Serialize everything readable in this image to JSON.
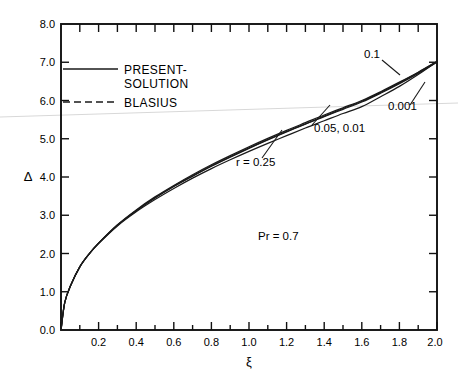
{
  "chart_data": {
    "type": "line",
    "title": "",
    "xlabel": "ξ",
    "ylabel": "Δ",
    "xlim": [
      0.0,
      2.0
    ],
    "ylim": [
      0.0,
      8.0
    ],
    "grid": false,
    "legend_position": "upper-left-inside",
    "x_ticks": [
      0.0,
      0.2,
      0.4,
      0.6,
      0.8,
      1.0,
      1.2,
      1.4,
      1.6,
      1.8,
      2.0
    ],
    "x_tick_labels": [
      "",
      "0.2",
      "0.4",
      "0.6",
      "0.8",
      "1.0",
      "1.2",
      "1.4",
      "1.6",
      "1.8",
      "2.0"
    ],
    "x_minor_step": 0.1,
    "y_ticks": [
      0.0,
      1.0,
      2.0,
      3.0,
      4.0,
      5.0,
      6.0,
      7.0,
      8.0
    ],
    "y_tick_labels": [
      "0.0",
      "1.0",
      "2.0",
      "3.0",
      "4.0",
      "5.0",
      "6.0",
      "7.0",
      "8.0"
    ],
    "series": [
      {
        "name": "r = 0.25",
        "style": "solid",
        "x": [
          0.0,
          0.02,
          0.05,
          0.1,
          0.15,
          0.2,
          0.3,
          0.4,
          0.5,
          0.6,
          0.7,
          0.8,
          0.9,
          1.0,
          1.1,
          1.2,
          1.3,
          1.4,
          1.5,
          1.6,
          1.7,
          1.8,
          1.9,
          2.0
        ],
        "y": [
          0.0,
          0.72,
          1.15,
          1.65,
          1.99,
          2.26,
          2.72,
          3.09,
          3.41,
          3.7,
          3.97,
          4.22,
          4.45,
          4.67,
          4.88,
          5.08,
          5.28,
          5.47,
          5.66,
          5.84,
          6.1,
          6.37,
          6.68,
          7.02
        ]
      },
      {
        "name": "0.1",
        "style": "solid",
        "x": [
          0.0,
          0.02,
          0.05,
          0.1,
          0.15,
          0.2,
          0.3,
          0.4,
          0.5,
          0.6,
          0.7,
          0.8,
          0.9,
          1.0,
          1.1,
          1.2,
          1.3,
          1.4,
          1.5,
          1.6,
          1.7,
          1.8,
          1.9,
          2.0
        ],
        "y": [
          0.0,
          0.72,
          1.15,
          1.65,
          1.99,
          2.27,
          2.75,
          3.14,
          3.48,
          3.78,
          4.06,
          4.32,
          4.56,
          4.79,
          5.01,
          5.22,
          5.42,
          5.62,
          5.81,
          6.0,
          6.23,
          6.48,
          6.74,
          7.02
        ]
      },
      {
        "name": "0.05, 0.01",
        "style": "solid",
        "x": [
          0.0,
          0.02,
          0.05,
          0.1,
          0.15,
          0.2,
          0.3,
          0.4,
          0.5,
          0.6,
          0.7,
          0.8,
          0.9,
          1.0,
          1.1,
          1.2,
          1.3,
          1.4,
          1.5,
          1.6,
          1.7,
          1.8,
          1.9,
          2.0
        ],
        "y": [
          0.0,
          0.72,
          1.15,
          1.65,
          1.99,
          2.27,
          2.74,
          3.12,
          3.46,
          3.76,
          4.03,
          4.29,
          4.53,
          4.76,
          4.98,
          5.19,
          5.39,
          5.59,
          5.79,
          5.98,
          6.21,
          6.46,
          6.73,
          7.02
        ]
      },
      {
        "name": "0.001",
        "style": "solid",
        "x": [
          0.0,
          0.02,
          0.05,
          0.1,
          0.15,
          0.2,
          0.3,
          0.4,
          0.5,
          0.6,
          0.7,
          0.8,
          0.9,
          1.0,
          1.1,
          1.2,
          1.3,
          1.4,
          1.5,
          1.6,
          1.7,
          1.8,
          1.9,
          2.0
        ],
        "y": [
          0.0,
          0.72,
          1.15,
          1.65,
          1.99,
          2.27,
          2.74,
          3.12,
          3.45,
          3.75,
          4.02,
          4.28,
          4.52,
          4.75,
          4.97,
          5.18,
          5.38,
          5.58,
          5.77,
          5.96,
          6.19,
          6.44,
          6.71,
          7.0
        ]
      }
    ],
    "annotations": [
      {
        "id": "curve-label-0p1",
        "text": "0.1",
        "x": 1.62,
        "y": 7.3
      },
      {
        "id": "curve-label-0p001",
        "text": "0.001",
        "x": 1.8,
        "y": 6.18
      },
      {
        "id": "curve-label-0p05-0p01",
        "text": "0.05, 0.01",
        "x": 1.5,
        "y": 5.6
      },
      {
        "id": "curve-label-r025",
        "text": "r = 0.25",
        "x": 1.02,
        "y": 4.22
      },
      {
        "id": "prandtl-note",
        "text": "Pr = 0.7",
        "x": 1.22,
        "y": 2.3
      }
    ]
  },
  "legend": {
    "entries": [
      {
        "label_line1": "PRESENT-",
        "label_line2": "SOLUTION",
        "style": "solid"
      },
      {
        "label_line1": "BLASIUS",
        "label_line2": "",
        "style": "dashed"
      }
    ]
  }
}
